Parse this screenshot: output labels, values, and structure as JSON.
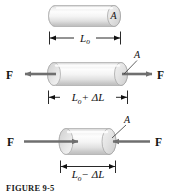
{
  "figure": {
    "caption": "FIGURE 9-5",
    "colors": {
      "cylinder_light": "#fcfcfc",
      "cylinder_mid": "#e2e2e2",
      "cylinder_shadow": "#b9b9b9",
      "outline": "#9a9a9a",
      "arrow": "#6f6f6f",
      "text": "#111111",
      "dimension_line": "#111111",
      "background": "#ffffff"
    },
    "panels": [
      {
        "id": "unstressed",
        "area_label": "A",
        "dimension_label": "L₀",
        "dimension_label_base": "L",
        "dimension_label_sub": "o",
        "dimension_label_suffix": "",
        "forces": []
      },
      {
        "id": "tension",
        "area_label": "A",
        "dimension_label": "L₀ + ΔL",
        "dimension_label_base": "L",
        "dimension_label_sub": "o",
        "dimension_label_suffix": "+ ΔL",
        "forces": [
          {
            "label": "F",
            "direction": "left"
          },
          {
            "label": "F",
            "direction": "right"
          }
        ]
      },
      {
        "id": "compression",
        "area_label": "A",
        "dimension_label": "L₀ − ΔL",
        "dimension_label_base": "L",
        "dimension_label_sub": "o",
        "dimension_label_suffix": "− ΔL",
        "forces": [
          {
            "label": "F",
            "direction": "right"
          },
          {
            "label": "F",
            "direction": "left"
          }
        ]
      }
    ]
  }
}
